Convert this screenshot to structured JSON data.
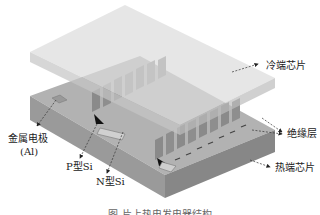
{
  "diagram": {
    "type": "exploded 3D schematic",
    "components": [
      {
        "id": "cold_chip",
        "label": "冷端芯片"
      },
      {
        "id": "insulation",
        "label": "绝缘层"
      },
      {
        "id": "hot_chip",
        "label": "热端芯片"
      },
      {
        "id": "metal_electrode",
        "label": "金属电极",
        "sublabel": "(Al)"
      },
      {
        "id": "p_si",
        "label": "P型Si"
      },
      {
        "id": "n_si",
        "label": "N型Si"
      }
    ],
    "caption": "图    片上热电发电器结构"
  },
  "colors": {
    "cold_chip_top": "#d8d8d8",
    "cold_chip_side": "#c2c2c2",
    "hot_chip_top": "#b4b4b4",
    "hot_chip_front": "#9c9c9c",
    "hot_chip_side": "#8a8a8a",
    "leg": "#8e8e8e",
    "leg_face": "#a8a8a8",
    "junction_dark": "#111111",
    "text": "#222222"
  }
}
